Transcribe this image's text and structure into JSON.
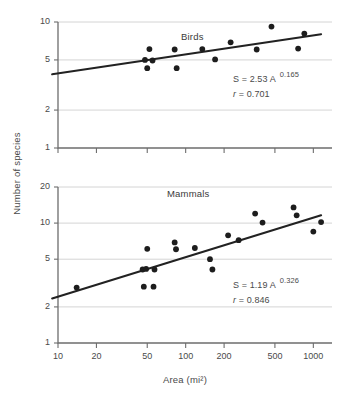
{
  "figure": {
    "axis_titles": {
      "y": "Number of species",
      "x": "Area (mi²)"
    }
  },
  "chart_data": [
    {
      "type": "scatter",
      "title": "Birds",
      "panel": "top",
      "xlabel": "Area (mi²)",
      "ylabel": "Number of species",
      "xscale": "log",
      "yscale": "log",
      "grid": true,
      "legend": "none",
      "xlim": [
        8,
        1500
      ],
      "ylim": [
        1,
        10
      ],
      "xticks": [
        10,
        20,
        50,
        100,
        200,
        500,
        1000
      ],
      "xtick_labels": [
        "10",
        "20",
        "50",
        "100",
        "200",
        "500",
        "1000"
      ],
      "yticks": [
        1,
        2,
        5,
        10
      ],
      "ytick_labels": [
        "1",
        "2",
        "5",
        "10"
      ],
      "annotations": {
        "equation_prefix": "S = 2.53 A",
        "equation_exponent": "0.165",
        "correlation_symbol": "r",
        "correlation_text": "= 0.701",
        "r_value": 0.701,
        "coefficient": 2.53,
        "exponent": 0.165
      },
      "fit": {
        "x_start": 9,
        "y_start": 3.85,
        "x_end": 1150,
        "y_end": 8.0
      },
      "points": [
        {
          "x": 48,
          "y": 5.0
        },
        {
          "x": 50,
          "y": 4.3
        },
        {
          "x": 52,
          "y": 6.1
        },
        {
          "x": 55,
          "y": 4.95
        },
        {
          "x": 82,
          "y": 6.05
        },
        {
          "x": 85,
          "y": 4.3
        },
        {
          "x": 135,
          "y": 6.1
        },
        {
          "x": 170,
          "y": 5.05
        },
        {
          "x": 225,
          "y": 6.9
        },
        {
          "x": 360,
          "y": 6.05
        },
        {
          "x": 470,
          "y": 9.2
        },
        {
          "x": 760,
          "y": 6.15
        },
        {
          "x": 850,
          "y": 8.1
        }
      ]
    },
    {
      "type": "scatter",
      "title": "Mammals",
      "panel": "bottom",
      "xlabel": "Area (mi²)",
      "ylabel": "Number of species",
      "xscale": "log",
      "yscale": "log",
      "grid": true,
      "legend": "none",
      "xlim": [
        8,
        1500
      ],
      "ylim": [
        1,
        20
      ],
      "xticks": [
        10,
        20,
        50,
        100,
        200,
        500,
        1000
      ],
      "xtick_labels": [
        "10",
        "20",
        "50",
        "100",
        "200",
        "500",
        "1000"
      ],
      "yticks": [
        1,
        2,
        5,
        10,
        20
      ],
      "ytick_labels": [
        "1",
        "2",
        "5",
        "10",
        "20"
      ],
      "annotations": {
        "equation_prefix": "S = 1.19 A",
        "equation_exponent": "0.326",
        "correlation_symbol": "r",
        "correlation_text": "= 0.846",
        "r_value": 0.846,
        "coefficient": 1.19,
        "exponent": 0.326
      },
      "fit": {
        "x_start": 9,
        "y_start": 2.35,
        "x_end": 1150,
        "y_end": 11.6
      },
      "points": [
        {
          "x": 14,
          "y": 2.9
        },
        {
          "x": 46,
          "y": 4.1
        },
        {
          "x": 47,
          "y": 2.95
        },
        {
          "x": 49,
          "y": 4.15
        },
        {
          "x": 50,
          "y": 6.1
        },
        {
          "x": 56,
          "y": 2.95
        },
        {
          "x": 57,
          "y": 4.1
        },
        {
          "x": 82,
          "y": 6.9
        },
        {
          "x": 84,
          "y": 6.05
        },
        {
          "x": 118,
          "y": 6.2
        },
        {
          "x": 155,
          "y": 5.0
        },
        {
          "x": 162,
          "y": 4.1
        },
        {
          "x": 215,
          "y": 7.9
        },
        {
          "x": 260,
          "y": 7.2
        },
        {
          "x": 350,
          "y": 12.0
        },
        {
          "x": 400,
          "y": 10.1
        },
        {
          "x": 700,
          "y": 13.5
        },
        {
          "x": 740,
          "y": 11.6
        },
        {
          "x": 1000,
          "y": 8.5
        },
        {
          "x": 1150,
          "y": 10.2
        }
      ]
    }
  ]
}
